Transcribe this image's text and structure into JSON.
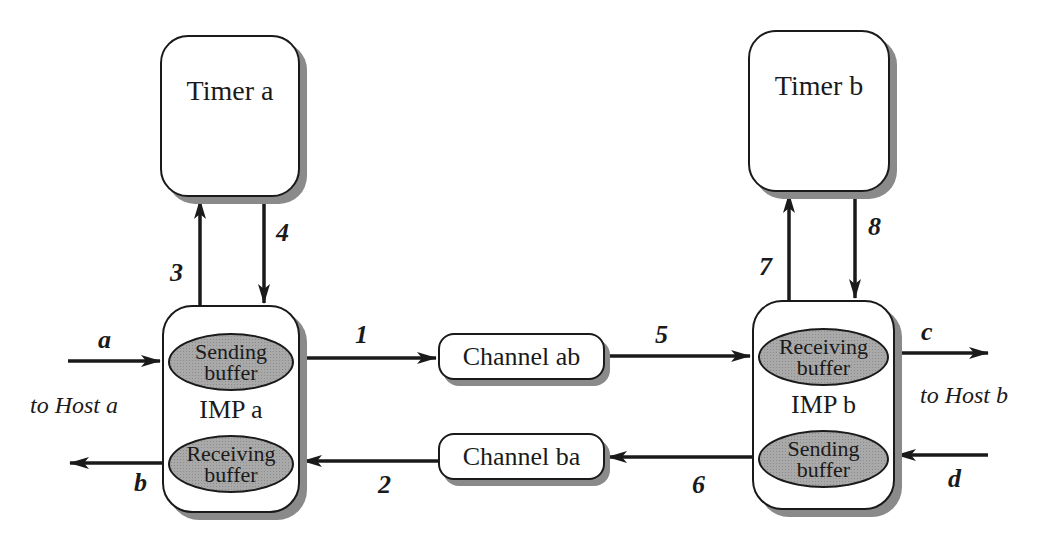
{
  "timers": {
    "a": {
      "label": "Timer a"
    },
    "b": {
      "label": "Timer b"
    }
  },
  "imps": {
    "a": {
      "label": "IMP a",
      "top_buffer": [
        "Sending",
        "buffer"
      ],
      "bottom_buffer": [
        "Receiving",
        "buffer"
      ]
    },
    "b": {
      "label": "IMP b",
      "top_buffer": [
        "Receiving",
        "buffer"
      ],
      "bottom_buffer": [
        "Sending",
        "buffer"
      ]
    }
  },
  "channels": {
    "ab": {
      "label": "Channel ab"
    },
    "ba": {
      "label": "Channel ba"
    }
  },
  "hosts": {
    "a": {
      "label": "to Host a"
    },
    "b": {
      "label": "to Host b"
    }
  },
  "edge_labels": {
    "e1": "1",
    "e2": "2",
    "e3": "3",
    "e4": "4",
    "e5": "5",
    "e6": "6",
    "e7": "7",
    "e8": "8",
    "ea": "a",
    "eb": "b",
    "ec": "c",
    "ed": "d"
  },
  "colors": {
    "line": "#1a1a1a",
    "shadow": "#8a8a8a",
    "buffer_fill": "#a9a9a9"
  }
}
